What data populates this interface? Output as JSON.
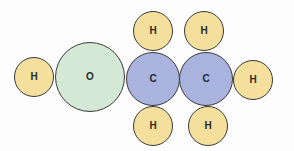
{
  "diagram": {
    "title": "",
    "colors": {
      "hydrogen": "#f4df9c",
      "oxygen": "#d4e8d6",
      "carbon": "#a9b3de",
      "outline": "#3a3a3a",
      "background": "#fdfdfd"
    },
    "atoms": [
      {
        "id": "h1",
        "element": "H",
        "label": "H",
        "cx": 34,
        "cy": 77,
        "r": 20
      },
      {
        "id": "o1",
        "element": "O",
        "label": "O",
        "cx": 90,
        "cy": 77,
        "r": 35
      },
      {
        "id": "c1",
        "element": "C",
        "label": "C",
        "cx": 153,
        "cy": 79,
        "r": 27
      },
      {
        "id": "c2",
        "element": "C",
        "label": "C",
        "cx": 206,
        "cy": 79,
        "r": 27
      },
      {
        "id": "h2",
        "element": "H",
        "label": "H",
        "cx": 253,
        "cy": 80,
        "r": 20
      },
      {
        "id": "h3",
        "element": "H",
        "label": "H",
        "cx": 153,
        "cy": 31,
        "r": 20
      },
      {
        "id": "h4",
        "element": "H",
        "label": "H",
        "cx": 204,
        "cy": 31,
        "r": 20
      },
      {
        "id": "h5",
        "element": "H",
        "label": "H",
        "cx": 153,
        "cy": 126,
        "r": 20
      },
      {
        "id": "h6",
        "element": "H",
        "label": "H",
        "cx": 208,
        "cy": 126,
        "r": 20
      }
    ]
  }
}
